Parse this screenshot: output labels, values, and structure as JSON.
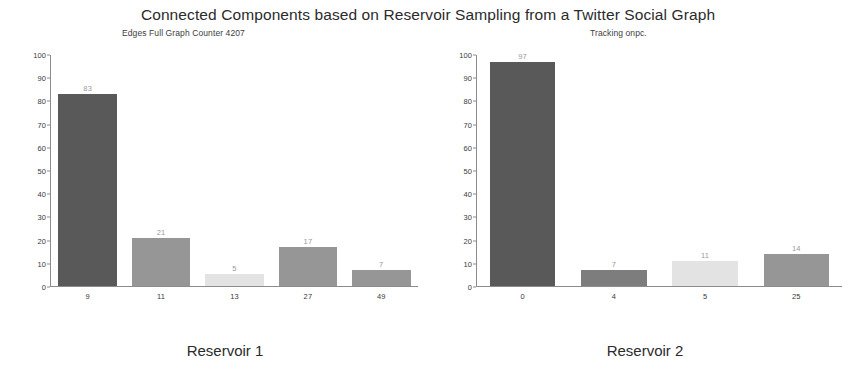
{
  "figure": {
    "title": "Connected Components based on Reservoir Sampling from a Twitter Social Graph"
  },
  "panels": [
    {
      "subtitle": "Edges Full Graph Counter  4207",
      "caption": "Reservoir 1"
    },
    {
      "subtitle": "Tracking  onpc.",
      "caption": "Reservoir 2"
    }
  ],
  "colors": {
    "bar_dark": "#595959",
    "bar_mid": "#969696",
    "bar_light": "#e3e3e3",
    "axis": "#8c8c8c",
    "value_label": "#9a9a9a",
    "tick_label": "#3a3a3a",
    "background": "#ffffff"
  },
  "chart_data": [
    {
      "type": "bar",
      "title": "Edges Full Graph Counter  4207",
      "caption": "Reservoir 1",
      "categories": [
        "9",
        "11",
        "13",
        "27",
        "49"
      ],
      "values": [
        83,
        21,
        5,
        17,
        7
      ],
      "bar_colors": [
        "#595959",
        "#969696",
        "#e3e3e3",
        "#969696",
        "#969696"
      ],
      "xlabel": "",
      "ylabel": "",
      "ylim": [
        0,
        100
      ],
      "yticks": [
        0,
        10,
        20,
        30,
        40,
        50,
        60,
        70,
        80,
        90,
        100
      ],
      "grid": false,
      "legend": false,
      "data_labels": true
    },
    {
      "type": "bar",
      "title": "Tracking  onpc.",
      "caption": "Reservoir 2",
      "categories": [
        "0",
        "4",
        "5",
        "25"
      ],
      "values": [
        97,
        7,
        11,
        14
      ],
      "bar_colors": [
        "#595959",
        "#7d7d7d",
        "#e3e3e3",
        "#969696"
      ],
      "xlabel": "",
      "ylabel": "",
      "ylim": [
        0,
        100
      ],
      "yticks": [
        0,
        10,
        20,
        30,
        40,
        50,
        60,
        70,
        80,
        90,
        100
      ],
      "grid": false,
      "legend": false,
      "data_labels": true
    }
  ]
}
